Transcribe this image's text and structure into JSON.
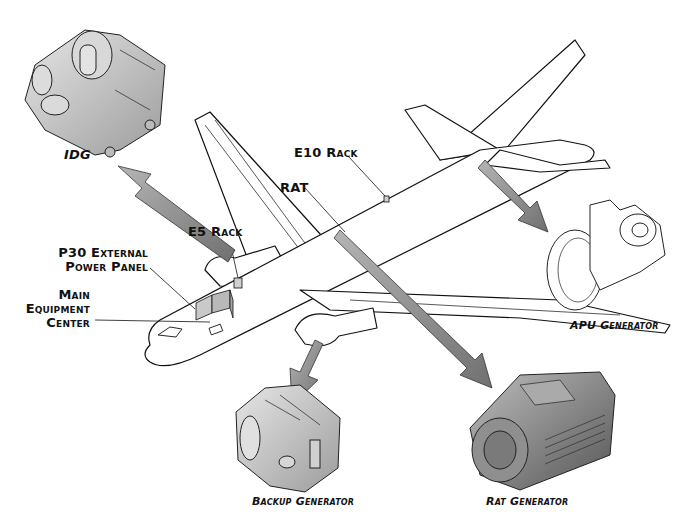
{
  "diagram": {
    "labels": {
      "idg": "IDG",
      "e10_rack": "E10 Rack",
      "rat": "RAT",
      "e5_rack": "E5 Rack",
      "p30_line1": "P30 External",
      "p30_line2": "Power Panel",
      "mec_line1": "Main",
      "mec_line2": "Equipment",
      "mec_line3": "Center",
      "apu_generator": "APU Generator",
      "backup_generator": "Backup Generator",
      "rat_generator": "Rat Generator"
    },
    "colors": {
      "outline": "#111111",
      "arrow_fill": "#8a8a8a",
      "component_fill": "#c8c8c8",
      "component_dark": "#9a9a9a",
      "background": "#ffffff"
    }
  }
}
